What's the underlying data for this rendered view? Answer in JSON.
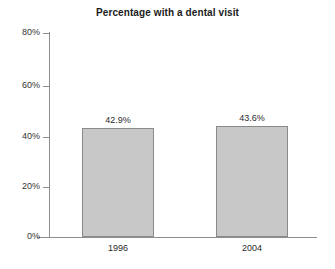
{
  "chart_data": {
    "type": "bar",
    "title": "Percentage with a dental visit",
    "xlabel": "",
    "ylabel": "",
    "categories": [
      "1996",
      "2004"
    ],
    "values": [
      42.9,
      43.6
    ],
    "value_labels": [
      "42.9%",
      "43.6%"
    ],
    "ylim": [
      0,
      80
    ],
    "ytick_values": [
      0,
      20,
      40,
      60,
      80
    ],
    "ytick_labels": [
      "0%",
      "20%",
      "40%",
      "60%",
      "80%"
    ],
    "grid": false,
    "legend": null,
    "series": [
      {
        "name": "Percentage with a dental visit",
        "values": [
          42.9,
          43.6
        ]
      }
    ],
    "colors": {
      "bar_fill": "#c8c8c8",
      "bar_border": "#8a8a8a",
      "axis": "#8e8e8e",
      "text": "#1b1b1b",
      "background": "#ffffff"
    }
  }
}
